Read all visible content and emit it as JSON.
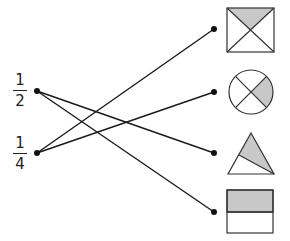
{
  "diagram": {
    "type": "matching",
    "left_items": [
      {
        "id": "half",
        "numerator": "1",
        "denominator": "2",
        "dot": [
          37,
          91
        ]
      },
      {
        "id": "quarter",
        "numerator": "1",
        "denominator": "4",
        "dot": [
          37,
          153
        ]
      }
    ],
    "right_items": [
      {
        "id": "square-x",
        "shape": "square divided by diagonals, top triangle shaded",
        "shaded_fraction": "1/4",
        "dot": [
          214,
          29
        ]
      },
      {
        "id": "circle-x",
        "shape": "circle divided into 4 quarters, right quarter shaded",
        "shaded_fraction": "1/4",
        "dot": [
          214,
          92
        ]
      },
      {
        "id": "triangle",
        "shape": "triangle split by line, upper-right part shaded",
        "shaded_fraction": "1/2",
        "dot": [
          214,
          153
        ]
      },
      {
        "id": "rectangle",
        "shape": "rectangle split horizontally, top half shaded",
        "shaded_fraction": "1/2",
        "dot": [
          214,
          212
        ]
      }
    ],
    "connections": [
      {
        "from": "half",
        "to": "triangle"
      },
      {
        "from": "half",
        "to": "rectangle"
      },
      {
        "from": "quarter",
        "to": "square-x"
      },
      {
        "from": "quarter",
        "to": "circle-x"
      }
    ],
    "colors": {
      "line": "#1a1a1a",
      "shade": "#c8c8c8",
      "outline": "#333333"
    }
  }
}
